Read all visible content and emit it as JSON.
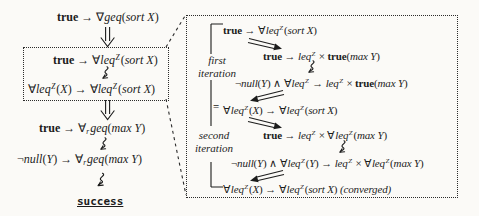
{
  "palette": {
    "paper": "#fbfaf7",
    "ink": "#1c1c1c",
    "border": "#2b2b2b"
  },
  "labels": {
    "success": "success",
    "first_iteration": "first iteration",
    "second_iteration": "second iteration",
    "bracket_junction": "="
  },
  "formulas": {
    "goal_geq": [
      {
        "t": "true",
        "s": "b"
      },
      {
        "t": " → ∇",
        "s": "r"
      },
      {
        "t": "geq",
        "s": "i"
      },
      {
        "t": "(",
        "s": "r"
      },
      {
        "t": "sort X",
        "s": "i"
      },
      {
        "t": ")",
        "s": "r"
      }
    ],
    "goal_leq": [
      {
        "t": "true",
        "s": "b"
      },
      {
        "t": " → ∀",
        "s": "r"
      },
      {
        "t": "leq",
        "s": "i"
      },
      {
        "t": "Z",
        "s": "sup"
      },
      {
        "t": "(",
        "s": "r"
      },
      {
        "t": "sort X",
        "s": "i"
      },
      {
        "t": ")",
        "s": "r"
      }
    ],
    "inv_leq": [
      {
        "t": "∀",
        "s": "r"
      },
      {
        "t": "leq",
        "s": "i"
      },
      {
        "t": "Z",
        "s": "sup"
      },
      {
        "t": "(",
        "s": "r"
      },
      {
        "t": "X",
        "s": "i"
      },
      {
        "t": ") → ∀",
        "s": "r"
      },
      {
        "t": "leq",
        "s": "i"
      },
      {
        "t": "Z",
        "s": "sup"
      },
      {
        "t": "(",
        "s": "r"
      },
      {
        "t": "sort X",
        "s": "i"
      },
      {
        "t": ")",
        "s": "r"
      }
    ],
    "goal_rgeq": [
      {
        "t": "true",
        "s": "b"
      },
      {
        "t": " → ∀",
        "s": "r"
      },
      {
        "t": "r",
        "s": "sub"
      },
      {
        "t": "geq",
        "s": "i"
      },
      {
        "t": "(",
        "s": "r"
      },
      {
        "t": "max Y",
        "s": "i"
      },
      {
        "t": ")",
        "s": "r"
      }
    ],
    "claim_rgeq": [
      {
        "t": "¬",
        "s": "r"
      },
      {
        "t": "null",
        "s": "i"
      },
      {
        "t": "(",
        "s": "r"
      },
      {
        "t": "Y",
        "s": "i"
      },
      {
        "t": ") → ∀",
        "s": "r"
      },
      {
        "t": "r",
        "s": "sub"
      },
      {
        "t": "geq",
        "s": "i"
      },
      {
        "t": "(",
        "s": "r"
      },
      {
        "t": "max Y",
        "s": "i"
      },
      {
        "t": ")",
        "s": "r"
      }
    ],
    "iter1_call": [
      {
        "t": "true",
        "s": "b"
      },
      {
        "t": " → ",
        "s": "r"
      },
      {
        "t": "leq",
        "s": "i"
      },
      {
        "t": "Z",
        "s": "sup"
      },
      {
        "t": " × ",
        "s": "r"
      },
      {
        "t": "true",
        "s": "b"
      },
      {
        "t": "(",
        "s": "r"
      },
      {
        "t": "max Y",
        "s": "i"
      },
      {
        "t": ")",
        "s": "r"
      }
    ],
    "iter1_result": [
      {
        "t": "¬",
        "s": "r"
      },
      {
        "t": "null",
        "s": "i"
      },
      {
        "t": "(",
        "s": "r"
      },
      {
        "t": "Y",
        "s": "i"
      },
      {
        "t": ") ∧ ∀",
        "s": "r"
      },
      {
        "t": "leq",
        "s": "i"
      },
      {
        "t": "Z",
        "s": "sup"
      },
      {
        "t": " → ",
        "s": "r"
      },
      {
        "t": "leq",
        "s": "i"
      },
      {
        "t": "Z",
        "s": "sup"
      },
      {
        "t": " × ",
        "s": "r"
      },
      {
        "t": "true",
        "s": "b"
      },
      {
        "t": "(",
        "s": "r"
      },
      {
        "t": "max Y",
        "s": "i"
      },
      {
        "t": ")",
        "s": "r"
      }
    ],
    "iter2_call": [
      {
        "t": "true",
        "s": "b"
      },
      {
        "t": " → ",
        "s": "r"
      },
      {
        "t": "leq",
        "s": "i"
      },
      {
        "t": "Z",
        "s": "sup"
      },
      {
        "t": " × ∀",
        "s": "r"
      },
      {
        "t": "leq",
        "s": "i"
      },
      {
        "t": "Z",
        "s": "sup"
      },
      {
        "t": "(",
        "s": "r"
      },
      {
        "t": "max Y",
        "s": "i"
      },
      {
        "t": ")",
        "s": "r"
      }
    ],
    "iter2_result": [
      {
        "t": "¬",
        "s": "r"
      },
      {
        "t": "null",
        "s": "i"
      },
      {
        "t": "(",
        "s": "r"
      },
      {
        "t": "Y",
        "s": "i"
      },
      {
        "t": ") ∧ ∀",
        "s": "r"
      },
      {
        "t": "leq",
        "s": "i"
      },
      {
        "t": "Z",
        "s": "sup"
      },
      {
        "t": "(",
        "s": "r"
      },
      {
        "t": "Y",
        "s": "i"
      },
      {
        "t": ") → ",
        "s": "r"
      },
      {
        "t": "leq",
        "s": "i"
      },
      {
        "t": "Z",
        "s": "sup"
      },
      {
        "t": " × ∀",
        "s": "r"
      },
      {
        "t": "leq",
        "s": "i"
      },
      {
        "t": "Z",
        "s": "sup"
      },
      {
        "t": "(",
        "s": "r"
      },
      {
        "t": "max Y",
        "s": "i"
      },
      {
        "t": ")",
        "s": "r"
      }
    ],
    "converged": [
      {
        "t": "∀",
        "s": "r"
      },
      {
        "t": "leq",
        "s": "i"
      },
      {
        "t": "Z",
        "s": "sup"
      },
      {
        "t": "(",
        "s": "r"
      },
      {
        "t": "X",
        "s": "i"
      },
      {
        "t": ") → ∀",
        "s": "r"
      },
      {
        "t": "leq",
        "s": "i"
      },
      {
        "t": "Z",
        "s": "sup"
      },
      {
        "t": "(",
        "s": "r"
      },
      {
        "t": "sort X",
        "s": "i"
      },
      {
        "t": ") ",
        "s": "r"
      },
      {
        "t": "(converged)",
        "s": "i"
      }
    ]
  },
  "icons": {
    "double-down-arrow-icon": "⇓",
    "squiggle-arrow-down-icon": "⇝",
    "double-down-right-arrow-icon": "⇘",
    "double-down-left-arrow-icon": "⇙",
    "zoom-connector-line": "dashed-line"
  }
}
